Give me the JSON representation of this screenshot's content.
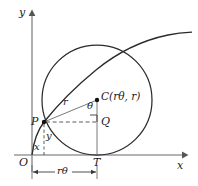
{
  "figure": {
    "background": "#ffffff",
    "stroke_color": "#2b2b2b",
    "axis_color": "#9a9a9a",
    "dash_color": "#4a4a4a",
    "width": 198,
    "height": 186
  },
  "axes": {
    "x_label": "x",
    "y_label": "y",
    "origin_label": "O",
    "x_axis_y": 155,
    "y_axis_x": 32,
    "x_axis_end": 186,
    "y_axis_top": 14
  },
  "points": {
    "origin": {
      "label": "O",
      "x": 32,
      "y": 155
    },
    "P": {
      "label": "P",
      "x": 44,
      "y": 122
    },
    "Q": {
      "label": "Q",
      "x": 97,
      "y": 122
    },
    "T": {
      "label": "T",
      "x": 97,
      "y": 155
    },
    "C": {
      "label": "C(rθ, r)",
      "x": 97,
      "y": 100
    }
  },
  "circle": {
    "center_x": 97,
    "center_y": 100,
    "radius": 55
  },
  "segments": {
    "radius_label": "r",
    "angle_label": "θ",
    "height_label": "y",
    "offset_label": "x"
  },
  "dimension": {
    "label": "rθ",
    "from_x": 32,
    "to_x": 97,
    "y": 172
  },
  "curve": {
    "name": "cycloid-arc"
  }
}
